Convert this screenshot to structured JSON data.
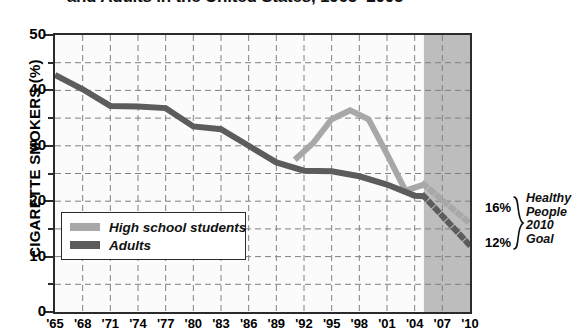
{
  "chart_data": {
    "type": "line",
    "title_visible": "and Adults in the United States, 1965–2005",
    "xlabel": "",
    "ylabel": "CIGARETTE SMOKERS (%)",
    "ylim": [
      0,
      50
    ],
    "xlim": [
      1965,
      2010
    ],
    "y_ticks": [
      0,
      10,
      20,
      30,
      40,
      50
    ],
    "y_minor_ticks": [
      5,
      15,
      25,
      35,
      45
    ],
    "x_ticks": [
      1965,
      1968,
      1971,
      1974,
      1977,
      1980,
      1983,
      1986,
      1989,
      1992,
      1995,
      1998,
      2001,
      2004,
      2007,
      2010
    ],
    "x_tick_labels": [
      "'65",
      "'68",
      "'71",
      "'74",
      "'77",
      "'80",
      "'83",
      "'86",
      "'89",
      "'92",
      "'95",
      "'98",
      "'01",
      "'04",
      "'07",
      "'10"
    ],
    "grid": true,
    "grid_style": "dashed",
    "legend_position": "lower-left",
    "projection_shading": {
      "label": "projection-band",
      "x_start": 2005,
      "x_end": 2010,
      "color": "#bdbdbd"
    },
    "series": [
      {
        "name": "High school students",
        "color": "#a8a8a8",
        "x": [
          1991,
          1993,
          1995,
          1997,
          1999,
          2001,
          2003,
          2005
        ],
        "values": [
          27.5,
          30.5,
          34.8,
          36.4,
          34.8,
          28.5,
          21.9,
          23.0
        ],
        "projection": {
          "style": "dotted",
          "x": [
            2005,
            2010
          ],
          "values": [
            23.0,
            16.0
          ],
          "endpoint_label": "16%"
        }
      },
      {
        "name": "Adults",
        "color": "#5c5c5c",
        "x": [
          1965,
          1968,
          1971,
          1974,
          1977,
          1980,
          1983,
          1986,
          1989,
          1992,
          1995,
          1998,
          2001,
          2004,
          2005
        ],
        "values": [
          42.8,
          40.2,
          37.2,
          37.1,
          36.8,
          33.5,
          33.0,
          30.0,
          27.0,
          25.5,
          25.4,
          24.5,
          23.0,
          21.0,
          20.9
        ],
        "projection": {
          "style": "dotted",
          "x": [
            2005,
            2010
          ],
          "values": [
            20.9,
            12.0
          ],
          "endpoint_label": "12%"
        }
      }
    ],
    "annotations": [
      {
        "name": "goal-16",
        "text": "16%",
        "value": 16
      },
      {
        "name": "goal-12",
        "text": "12%",
        "value": 12
      },
      {
        "name": "goal-caption-line1",
        "text": "Healthy"
      },
      {
        "name": "goal-caption-line2",
        "text": "People"
      },
      {
        "name": "goal-caption-line3",
        "text": "2010"
      },
      {
        "name": "goal-caption-line4",
        "text": "Goal"
      }
    ]
  },
  "legend": {
    "items": [
      {
        "label": "High school students",
        "color": "#a8a8a8"
      },
      {
        "label": "Adults",
        "color": "#5c5c5c"
      }
    ]
  },
  "colors": {
    "high_school": "#a8a8a8",
    "adults": "#5c5c5c",
    "axis": "#2b2b2b",
    "grid": "#808080",
    "shaded_band": "#bdbdbd",
    "plot_background": "#fbfbfb"
  }
}
